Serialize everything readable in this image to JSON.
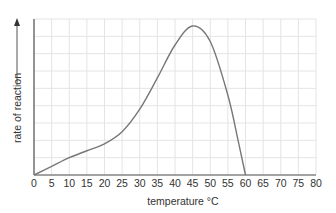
{
  "chart_data": {
    "type": "line",
    "title": "",
    "xlabel": "temperature °C",
    "ylabel": "rate of reaction",
    "x_ticks": [
      0,
      5,
      10,
      15,
      20,
      25,
      30,
      35,
      40,
      45,
      50,
      55,
      60,
      65,
      70,
      75,
      80
    ],
    "xlim": [
      0,
      80
    ],
    "ylim": [
      0,
      9
    ],
    "y_ticks_shown": false,
    "grid": true,
    "legend": null,
    "series": [
      {
        "name": "rate of reaction",
        "x": [
          0,
          5,
          10,
          15,
          20,
          25,
          30,
          35,
          40,
          45,
          50,
          55,
          58,
          60
        ],
        "y": [
          0,
          0.5,
          1.0,
          1.4,
          1.8,
          2.5,
          3.8,
          5.6,
          7.5,
          8.6,
          7.7,
          4.6,
          1.9,
          0
        ]
      }
    ],
    "annotations": [
      "y-axis arrow pointing up next to ylabel"
    ]
  },
  "colors": {
    "grid": "#e4e4e4",
    "axis": "#555555",
    "curve": "#777777",
    "text": "#333333"
  }
}
